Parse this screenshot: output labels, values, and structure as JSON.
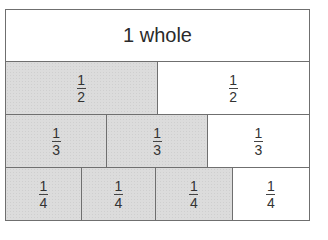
{
  "diagram": {
    "type": "fraction-wall",
    "colors": {
      "shaded": "#dcdcdc",
      "unshaded": "#ffffff",
      "border": "#6f6f6f"
    },
    "rows": [
      {
        "name": "whole",
        "label": "1 whole",
        "cells": [
          {
            "numerator": "",
            "denominator": "",
            "shaded": false
          }
        ]
      },
      {
        "name": "halves",
        "cells": [
          {
            "numerator": "1",
            "denominator": "2",
            "shaded": true
          },
          {
            "numerator": "1",
            "denominator": "2",
            "shaded": false
          }
        ]
      },
      {
        "name": "thirds",
        "cells": [
          {
            "numerator": "1",
            "denominator": "3",
            "shaded": true
          },
          {
            "numerator": "1",
            "denominator": "3",
            "shaded": true
          },
          {
            "numerator": "1",
            "denominator": "3",
            "shaded": false
          }
        ]
      },
      {
        "name": "quarters",
        "cells": [
          {
            "numerator": "1",
            "denominator": "4",
            "shaded": true
          },
          {
            "numerator": "1",
            "denominator": "4",
            "shaded": true
          },
          {
            "numerator": "1",
            "denominator": "4",
            "shaded": true
          },
          {
            "numerator": "1",
            "denominator": "4",
            "shaded": false
          }
        ]
      }
    ]
  }
}
